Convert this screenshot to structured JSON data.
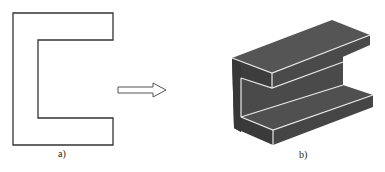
{
  "figure": {
    "panel_a": {
      "label": "a)",
      "description": "2D C-shaped profile outline"
    },
    "arrow": {
      "description": "hollow right arrow indicating extrusion"
    },
    "panel_b": {
      "label": "b)",
      "description": "3D extruded C-channel solid"
    }
  },
  "colors": {
    "outline": "#333333",
    "solid_dark": "#3a3a3a",
    "solid_mid": "#4a4a4a",
    "solid_light": "#555555",
    "edge_highlight": "#e8e8e8"
  }
}
